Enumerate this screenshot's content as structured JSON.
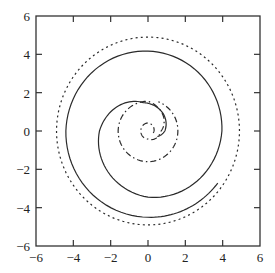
{
  "chart_data": {
    "type": "line",
    "title": "",
    "xlabel": "",
    "ylabel": "",
    "xlim": [
      -6,
      6
    ],
    "ylim": [
      -6,
      6
    ],
    "grid": false,
    "legend": null,
    "x_ticks": [
      -6,
      -4,
      -2,
      0,
      2,
      4,
      6
    ],
    "y_ticks": [
      -6,
      -4,
      -2,
      0,
      2,
      4,
      6
    ],
    "x_tick_labels": [
      "−6",
      "−4",
      "−2",
      "0",
      "2",
      "4",
      "6"
    ],
    "y_tick_labels": [
      "−6",
      "−4",
      "−2",
      "0",
      "2",
      "4",
      "6"
    ],
    "series": [
      {
        "name": "dotted-circle",
        "style": "dotted",
        "kind": "circle",
        "center": [
          0,
          0
        ],
        "radius": 4.9
      },
      {
        "name": "solid-spiral",
        "style": "solid",
        "kind": "spiral",
        "description": "Inward-to-outward spiral starting near (0.5,-0.3), passing top (0,1.5), left (-2.6,0), bottom (0,-3.5), right (4.0,0), top (0,4.2), left (-4.4,0), bottom (0,-4.5), ending near (3.75,-2.7)",
        "key_points": [
          [
            0.5,
            -0.3
          ],
          [
            -0.3,
            1.5
          ],
          [
            -2.6,
            0
          ],
          [
            0,
            -3.45
          ],
          [
            3.96,
            0
          ],
          [
            0,
            4.17
          ],
          [
            -4.4,
            0
          ],
          [
            0,
            -4.5
          ],
          [
            3.75,
            -2.7
          ]
        ]
      },
      {
        "name": "dashdot-spiral",
        "style": "dashdot",
        "kind": "spiral",
        "description": "Small spiral around origin: inner loop radius ~0.4, outer loop radius ~1.6",
        "key_points": [
          [
            0.3,
            0
          ],
          [
            0,
            0.45
          ],
          [
            -0.35,
            0
          ],
          [
            0,
            -0.4
          ],
          [
            0.8,
            0.1
          ],
          [
            0,
            1.6
          ],
          [
            -1.6,
            0
          ],
          [
            0,
            -1.6
          ],
          [
            1.6,
            0
          ],
          [
            0.3,
            1.6
          ]
        ]
      }
    ]
  }
}
